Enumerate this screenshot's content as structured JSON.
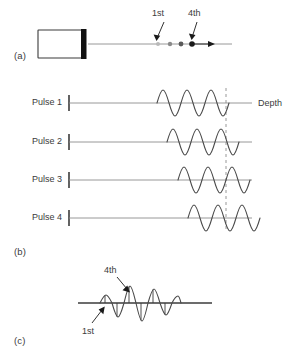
{
  "figure": {
    "panels": [
      {
        "id": "a",
        "label": "(a)"
      },
      {
        "id": "b",
        "label": "(b)"
      },
      {
        "id": "c",
        "label": "(c)"
      }
    ]
  },
  "panel_a": {
    "label": "(a)",
    "transducer_name": "transducer-probe",
    "beam_axis": {
      "x1": 88,
      "x2": 232,
      "y": 44
    },
    "annotations": [
      {
        "text": "1st",
        "x": 160,
        "y": 14,
        "arrow_from": [
          168,
          24
        ],
        "arrow_to": [
          160,
          40
        ]
      },
      {
        "text": "4th",
        "x": 196,
        "y": 14,
        "arrow_from": [
          198,
          24
        ],
        "arrow_to": [
          192,
          40
        ]
      }
    ],
    "scatterers": [
      {
        "label": "1st",
        "x": 158,
        "y": 44,
        "r": 2.0,
        "color": "#b9b9b9"
      },
      {
        "label": "2nd",
        "x": 170,
        "y": 44,
        "r": 2.2,
        "color": "#8a8a8a"
      },
      {
        "label": "3rd",
        "x": 181,
        "y": 44,
        "r": 2.4,
        "color": "#5a5a5a"
      },
      {
        "label": "4th",
        "x": 192,
        "y": 44,
        "r": 2.6,
        "color": "#1a1a1a"
      }
    ],
    "motion_arrow": {
      "x1": 192,
      "x2": 214,
      "y": 44
    }
  },
  "panel_b": {
    "label": "(b)",
    "depth_axis_label": "Depth",
    "dashed_marker_x": 226,
    "rows": [
      {
        "label": "Pulse 1",
        "baseline_y": 103,
        "wave_start_x": 157,
        "cycles": 3,
        "amplitude": 13,
        "wavelength": 24
      },
      {
        "label": "Pulse 2",
        "baseline_y": 142,
        "wave_start_x": 167,
        "cycles": 3,
        "amplitude": 13,
        "wavelength": 24
      },
      {
        "label": "Pulse 3",
        "baseline_y": 180,
        "wave_start_x": 178,
        "cycles": 3,
        "amplitude": 13,
        "wavelength": 24
      },
      {
        "label": "Pulse 4",
        "baseline_y": 218,
        "wave_start_x": 188,
        "cycles": 3,
        "amplitude": 13,
        "wavelength": 24
      }
    ],
    "axis_x_start": 68,
    "axis_x_end": 248,
    "tick_height": 16
  },
  "panel_c": {
    "label": "(c)",
    "baseline": {
      "x1": 78,
      "x2": 212,
      "y": 303
    },
    "annotations": [
      {
        "text": "4th",
        "x": 111,
        "y": 271,
        "arrow_from": [
          122,
          278
        ],
        "arrow_to": [
          134,
          293
        ]
      },
      {
        "text": "1st",
        "x": 86,
        "y": 330,
        "arrow_from": [
          95,
          325
        ],
        "arrow_to": [
          105,
          308
        ]
      }
    ],
    "wave_start_x": 100,
    "wave_end_x": 180,
    "samples": [
      {
        "x": 105,
        "value": -5
      },
      {
        "x": 117,
        "value": 11
      },
      {
        "x": 129,
        "value": -13
      },
      {
        "x": 141,
        "value": 9
      },
      {
        "x": 153,
        "value": 10
      },
      {
        "x": 165,
        "value": -6
      }
    ]
  },
  "colors": {
    "ink": "#3b3b3b",
    "gray_line": "#8d8d8d",
    "wave": "#4a4a4a",
    "arrow": "#1a1a1a",
    "probe_face": "#111111"
  }
}
